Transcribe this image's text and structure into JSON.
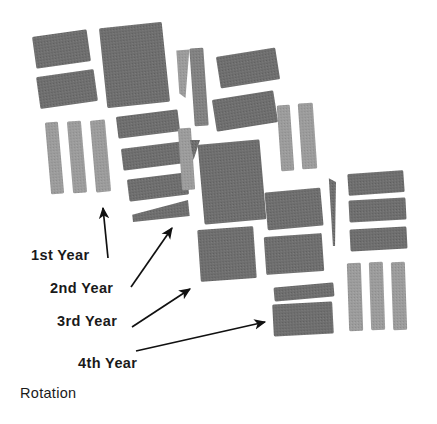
{
  "figure": {
    "title_visible": false,
    "background_color": "#ffffff",
    "ink_color": "#1a1a1a"
  },
  "annotations": {
    "year_1": "1st Year",
    "year_2": "2nd Year",
    "year_3": "3rd Year",
    "year_4": "4th Year",
    "caption": "Rotation"
  },
  "chart_data": {
    "type": "map",
    "title": "",
    "subtitle": "",
    "xlabel": "",
    "ylabel": "",
    "grid": false,
    "legend_position": "none",
    "fill_tones": {
      "dark": "#6f6f6f",
      "mid": "#828282",
      "light": "#9c9c9c"
    },
    "annotation_labels": [
      "1st Year",
      "2nd Year",
      "3rd Year",
      "4th Year",
      "Rotation"
    ],
    "plot_count": 34,
    "arrow_count": 4,
    "plots": [
      {
        "id": "p01",
        "cluster": "upper-left",
        "shape": "rect",
        "x": 34,
        "y": 33,
        "w": 55,
        "h": 32,
        "rot": -8,
        "tone": "dark"
      },
      {
        "id": "p02",
        "cluster": "upper-left",
        "shape": "rect",
        "x": 38,
        "y": 73,
        "w": 58,
        "h": 32,
        "rot": -8,
        "tone": "dark"
      },
      {
        "id": "p03",
        "cluster": "upper-left",
        "shape": "rect",
        "x": 48,
        "y": 122,
        "w": 13,
        "h": 72,
        "rot": -5,
        "tone": "light"
      },
      {
        "id": "p04",
        "cluster": "upper-left",
        "shape": "rect",
        "x": 70,
        "y": 121,
        "w": 14,
        "h": 72,
        "rot": -5,
        "tone": "light"
      },
      {
        "id": "p05",
        "cluster": "upper-left",
        "shape": "rect",
        "x": 93,
        "y": 120,
        "w": 15,
        "h": 72,
        "rot": -5,
        "tone": "light"
      },
      {
        "id": "p06",
        "cluster": "center-column",
        "shape": "rect",
        "x": 103,
        "y": 25,
        "w": 63,
        "h": 80,
        "rot": -6,
        "tone": "dark"
      },
      {
        "id": "p07",
        "cluster": "center-column",
        "shape": "rect",
        "x": 117,
        "y": 113,
        "w": 62,
        "h": 22,
        "rot": -7,
        "tone": "dark"
      },
      {
        "id": "p08",
        "cluster": "center-column",
        "shape": "rect",
        "x": 122,
        "y": 145,
        "w": 62,
        "h": 22,
        "rot": -7,
        "tone": "dark"
      },
      {
        "id": "p09",
        "cluster": "center-column",
        "shape": "rect",
        "x": 128,
        "y": 176,
        "w": 60,
        "h": 22,
        "rot": -7,
        "tone": "dark"
      },
      {
        "id": "p10",
        "cluster": "center-column",
        "shape": "wedge",
        "x": 132,
        "y": 203,
        "w": 57,
        "h": 16,
        "rot": -6,
        "tone": "dark"
      },
      {
        "id": "p11",
        "cluster": "center-strips",
        "shape": "wedge-v",
        "x": 178,
        "y": 50,
        "w": 13,
        "h": 48,
        "rot": -4,
        "tone": "light"
      },
      {
        "id": "p12",
        "cluster": "center-strips",
        "shape": "rect",
        "x": 192,
        "y": 48,
        "w": 14,
        "h": 78,
        "rot": -4,
        "tone": "mid"
      },
      {
        "id": "p13",
        "cluster": "center-strips",
        "shape": "rect",
        "x": 180,
        "y": 128,
        "w": 13,
        "h": 62,
        "rot": -4,
        "tone": "light"
      },
      {
        "id": "p14",
        "cluster": "center-strips",
        "shape": "tri",
        "x": 190,
        "y": 140,
        "w": 10,
        "h": 20,
        "rot": 0,
        "tone": "dark"
      },
      {
        "id": "p15",
        "cluster": "upper-right",
        "shape": "rect",
        "x": 218,
        "y": 52,
        "w": 60,
        "h": 32,
        "rot": -9,
        "tone": "dark"
      },
      {
        "id": "p16",
        "cluster": "upper-right",
        "shape": "rect",
        "x": 214,
        "y": 95,
        "w": 62,
        "h": 32,
        "rot": -9,
        "tone": "dark"
      },
      {
        "id": "p17",
        "cluster": "upper-right",
        "shape": "rect",
        "x": 201,
        "y": 142,
        "w": 62,
        "h": 80,
        "rot": -5,
        "tone": "dark"
      },
      {
        "id": "p18",
        "cluster": "upper-right",
        "shape": "rect",
        "x": 199,
        "y": 228,
        "w": 56,
        "h": 52,
        "rot": -4,
        "tone": "dark"
      },
      {
        "id": "p19",
        "cluster": "right-strips",
        "shape": "rect",
        "x": 279,
        "y": 105,
        "w": 13,
        "h": 66,
        "rot": -4,
        "tone": "light"
      },
      {
        "id": "p20",
        "cluster": "right-strips",
        "shape": "rect",
        "x": 300,
        "y": 103,
        "w": 15,
        "h": 66,
        "rot": -4,
        "tone": "light"
      },
      {
        "id": "p21",
        "cluster": "right-middle",
        "shape": "rect",
        "x": 266,
        "y": 190,
        "w": 56,
        "h": 38,
        "rot": -5,
        "tone": "dark"
      },
      {
        "id": "p22",
        "cluster": "right-middle",
        "shape": "rect",
        "x": 265,
        "y": 235,
        "w": 58,
        "h": 38,
        "rot": -4,
        "tone": "dark"
      },
      {
        "id": "p23",
        "cluster": "right-middle",
        "shape": "needle",
        "x": 330,
        "y": 178,
        "w": 7,
        "h": 68,
        "rot": -2,
        "tone": "dark"
      },
      {
        "id": "p24",
        "cluster": "lower-right",
        "shape": "rect",
        "x": 274,
        "y": 285,
        "w": 60,
        "h": 14,
        "rot": -5,
        "tone": "dark"
      },
      {
        "id": "p25",
        "cluster": "lower-right",
        "shape": "rect",
        "x": 273,
        "y": 303,
        "w": 60,
        "h": 32,
        "rot": -3,
        "tone": "dark"
      },
      {
        "id": "p26",
        "cluster": "far-right",
        "shape": "rect",
        "x": 348,
        "y": 172,
        "w": 56,
        "h": 22,
        "rot": -4,
        "tone": "dark"
      },
      {
        "id": "p27",
        "cluster": "far-right",
        "shape": "rect",
        "x": 349,
        "y": 199,
        "w": 57,
        "h": 22,
        "rot": -3,
        "tone": "dark"
      },
      {
        "id": "p28",
        "cluster": "far-right",
        "shape": "rect",
        "x": 350,
        "y": 228,
        "w": 57,
        "h": 22,
        "rot": -3,
        "tone": "dark"
      },
      {
        "id": "p29",
        "cluster": "far-right-strips",
        "shape": "rect",
        "x": 348,
        "y": 263,
        "w": 14,
        "h": 68,
        "rot": -2,
        "tone": "light"
      },
      {
        "id": "p30",
        "cluster": "far-right-strips",
        "shape": "rect",
        "x": 370,
        "y": 262,
        "w": 14,
        "h": 68,
        "rot": -2,
        "tone": "light"
      },
      {
        "id": "p31",
        "cluster": "far-right-strips",
        "shape": "rect",
        "x": 392,
        "y": 262,
        "w": 14,
        "h": 68,
        "rot": -2,
        "tone": "light"
      }
    ],
    "arrows": [
      {
        "id": "a1",
        "label": "1st Year",
        "x1": 108,
        "y1": 258,
        "x2": 103,
        "y2": 208
      },
      {
        "id": "a2",
        "label": "2nd Year",
        "x1": 131,
        "y1": 287,
        "x2": 172,
        "y2": 228
      },
      {
        "id": "a3",
        "label": "3rd Year",
        "x1": 132,
        "y1": 327,
        "x2": 190,
        "y2": 289
      },
      {
        "id": "a4",
        "label": "4th Year",
        "x1": 136,
        "y1": 351,
        "x2": 265,
        "y2": 322
      }
    ]
  }
}
